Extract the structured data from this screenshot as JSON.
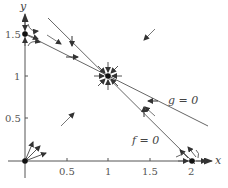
{
  "figure": {
    "type": "phase-plane",
    "axes": {
      "x_label": "x",
      "y_label": "y",
      "x_ticks": [
        {
          "value": 0.5,
          "label": "0.5"
        },
        {
          "value": 1,
          "label": "1"
        },
        {
          "value": 1.5,
          "label": "1.5"
        },
        {
          "value": 2,
          "label": "2"
        }
      ],
      "y_ticks": [
        {
          "value": 0.5,
          "label": "0.5"
        },
        {
          "value": 1,
          "label": "1"
        },
        {
          "value": 1.5,
          "label": "1.5"
        }
      ]
    },
    "nullclines": [
      {
        "name": "f = 0",
        "label": "f = 0",
        "from": [
          0.28,
          1.72
        ],
        "to": [
          2,
          0
        ]
      },
      {
        "name": "g = 0",
        "label": "g = 0",
        "from": [
          0,
          1.5
        ],
        "to": [
          2.2,
          0.42
        ]
      }
    ],
    "equilibria": [
      {
        "name": "origin",
        "x": 0,
        "y": 0,
        "type": "source"
      },
      {
        "name": "y-axis",
        "x": 0,
        "y": 1.5,
        "type": "saddle"
      },
      {
        "name": "interior",
        "x": 1,
        "y": 1,
        "type": "sink"
      },
      {
        "name": "x-axis",
        "x": 2,
        "y": 0,
        "type": "saddle"
      }
    ],
    "colors": {
      "axis": "#555555",
      "line": "#666666",
      "point": "#111111",
      "arrow": "#444444"
    }
  }
}
